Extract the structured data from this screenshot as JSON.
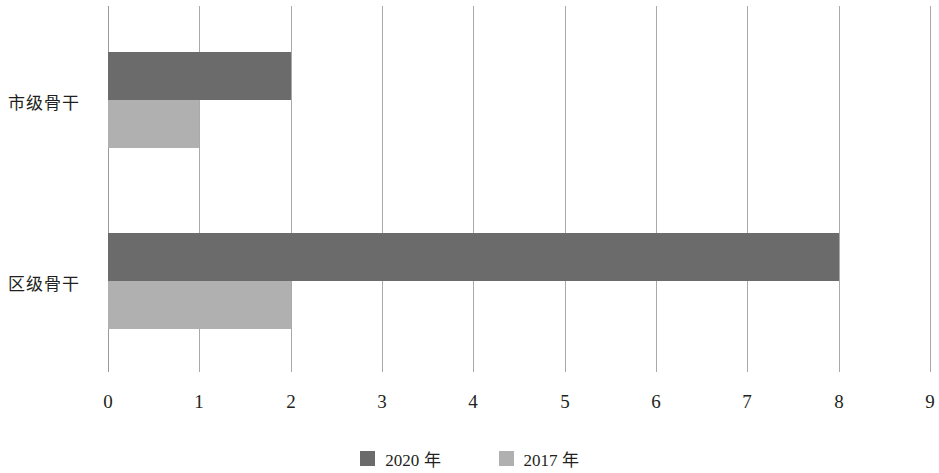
{
  "chart_data": {
    "type": "bar",
    "orientation": "horizontal",
    "title": "",
    "xlabel": "",
    "ylabel": "",
    "xlim": [
      0,
      9
    ],
    "grid": true,
    "legend_position": "bottom",
    "categories": [
      "市级骨干",
      "区级骨干"
    ],
    "x_ticks": [
      "0",
      "1",
      "2",
      "3",
      "4",
      "5",
      "6",
      "7",
      "8",
      "9"
    ],
    "x_tick_values": [
      0,
      1,
      2,
      3,
      4,
      5,
      6,
      7,
      8,
      9
    ],
    "series": [
      {
        "name": "2020 年",
        "color": "#6b6b6b",
        "values": [
          2,
          8
        ]
      },
      {
        "name": "2017 年",
        "color": "#b0b0b0",
        "values": [
          1,
          2
        ]
      }
    ]
  },
  "legend": {
    "items": [
      {
        "label": "2020 年",
        "color": "#6b6b6b"
      },
      {
        "label": "2017 年",
        "color": "#b0b0b0"
      }
    ]
  }
}
